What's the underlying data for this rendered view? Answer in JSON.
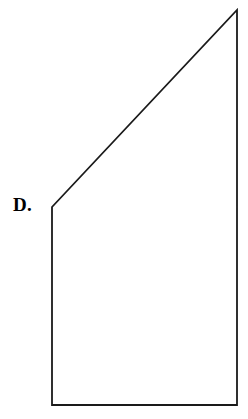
{
  "page": {
    "background_color": "#ffffff",
    "width": 248,
    "height": 419
  },
  "figure": {
    "label": "D.",
    "label_color": "#000000",
    "shape_name": "right-trapezoid",
    "stroke_color": "#1a1a1a",
    "fill_color": "#ffffff",
    "stroke_width": 1.8,
    "vertices": [
      {
        "name": "top-left",
        "x": 52,
        "y": 207
      },
      {
        "name": "top-right",
        "x": 237,
        "y": 10
      },
      {
        "name": "bottom-right",
        "x": 237,
        "y": 405
      },
      {
        "name": "bottom-left",
        "x": 52,
        "y": 405
      }
    ],
    "edges": [
      {
        "name": "slanted-top-edge",
        "from": "top-left",
        "to": "top-right"
      },
      {
        "name": "right-edge",
        "from": "top-right",
        "to": "bottom-right"
      },
      {
        "name": "bottom-edge",
        "from": "bottom-right",
        "to": "bottom-left"
      },
      {
        "name": "left-edge",
        "from": "bottom-left",
        "to": "top-left"
      }
    ],
    "polygon_points": "52,207 237,10 237,405 52,405"
  }
}
